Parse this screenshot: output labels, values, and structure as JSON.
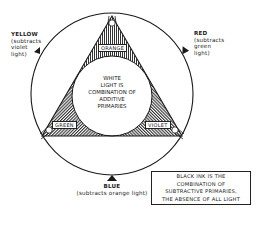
{
  "diagram": {
    "center_text": [
      "WHITE",
      "LIGHT IS",
      "COMBINATION OF",
      "ADDITIVE",
      "PRIMARIES"
    ],
    "segments": [
      {
        "label": "ORANGE",
        "position": "top"
      },
      {
        "label": "GREEN",
        "position": "bottom-left"
      },
      {
        "label": "VIOLET",
        "position": "bottom-right"
      }
    ],
    "pointers": [
      {
        "name": "YELLOW",
        "lines": [
          "(subtracts",
          "violet",
          "light)"
        ],
        "position": "upper-left"
      },
      {
        "name": "RED",
        "lines": [
          "(subtracts",
          "green",
          "light)"
        ],
        "position": "upper-right"
      },
      {
        "name": "BLUE",
        "lines": [
          "(subtracts orange light)"
        ],
        "position": "bottom"
      }
    ],
    "note": [
      "BLACK INK IS THE",
      "COMBINATION OF",
      "SUBTRACTIVE PRIMARIES,",
      "THE ABSENCE OF ALL LIGHT"
    ]
  },
  "colors": {
    "ink": "#1a1a1a",
    "background": "#ffffff"
  }
}
